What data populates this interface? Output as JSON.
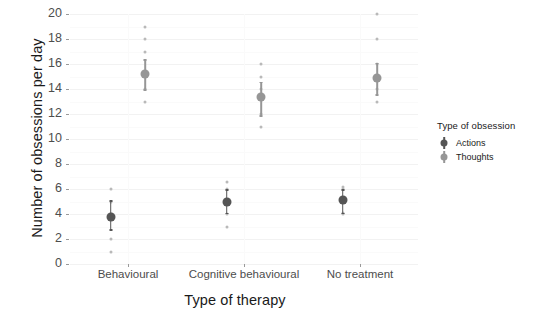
{
  "chart_data": {
    "type": "scatter",
    "title": "",
    "xlabel": "Type of therapy",
    "ylabel": "Number of obsessions per day",
    "categories": [
      "Behavioural",
      "Cognitive behavioural",
      "No treatment"
    ],
    "ylim": [
      0,
      20
    ],
    "yticks": [
      0,
      2,
      4,
      6,
      8,
      10,
      12,
      14,
      16,
      18,
      20
    ],
    "grid": true,
    "legend": {
      "title": "Type of obsession",
      "position": "right",
      "entries": [
        {
          "name": "Actions",
          "color": "#555555"
        },
        {
          "name": "Thoughts",
          "color": "#969696"
        }
      ]
    },
    "series": [
      {
        "name": "Actions",
        "color": "#555555",
        "points": [
          {
            "category": "Behavioural",
            "mean": 3.8,
            "low": 2.8,
            "high": 5.1,
            "raw": [
              6.0,
              5.0,
              4.0,
              2.0,
              1.0
            ]
          },
          {
            "category": "Cognitive behavioural",
            "mean": 5.0,
            "low": 4.1,
            "high": 6.0,
            "raw": [
              6.6,
              6.0,
              5.0,
              4.0,
              3.0
            ]
          },
          {
            "category": "No treatment",
            "mean": 5.1,
            "low": 4.1,
            "high": 6.0,
            "raw": [
              6.2,
              6.0,
              5.0,
              4.1,
              4.0
            ]
          }
        ]
      },
      {
        "name": "Thoughts",
        "color": "#969696",
        "points": [
          {
            "category": "Behavioural",
            "mean": 15.2,
            "low": 14.0,
            "high": 16.4,
            "raw": [
              19.0,
              18.0,
              17.0,
              14.0,
              13.0
            ]
          },
          {
            "category": "Cognitive behavioural",
            "mean": 13.4,
            "low": 11.9,
            "high": 14.6,
            "raw": [
              16.0,
              15.0,
              14.0,
              12.0,
              11.0
            ]
          },
          {
            "category": "No treatment",
            "mean": 14.9,
            "low": 13.6,
            "high": 16.1,
            "raw": [
              20.0,
              18.0,
              16.0,
              14.0,
              13.0
            ]
          }
        ]
      }
    ]
  },
  "axis": {
    "y_title": "Number of obsessions per day",
    "x_title": "Type of therapy",
    "y_tick_labels": [
      "0",
      "2",
      "4",
      "6",
      "8",
      "10",
      "12",
      "14",
      "16",
      "18",
      "20"
    ],
    "x_tick_labels": [
      "Behavioural",
      "Cognitive behavioural",
      "No treatment"
    ]
  },
  "legend": {
    "title": "Type of obsession",
    "items": [
      "Actions",
      "Thoughts"
    ]
  },
  "colors": {
    "actions": "#555555",
    "thoughts": "#969696",
    "raw_dot": "#b9b9b9",
    "grid": "#f2f2f2",
    "text": "#1a1a1a",
    "tick_text": "#4d4d4d",
    "background": "#ffffff"
  }
}
